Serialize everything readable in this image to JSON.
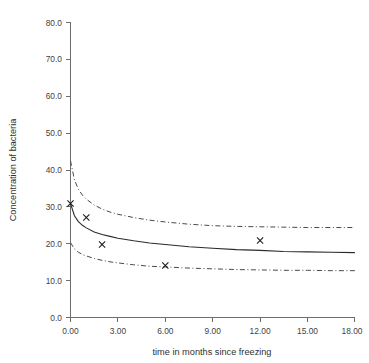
{
  "chart_data": {
    "type": "line",
    "title": "",
    "xlabel": "time in months since freezing",
    "ylabel": "Concentration of bacteria",
    "xlim": [
      0,
      18
    ],
    "ylim": [
      0,
      80
    ],
    "xticks": [
      "0.00",
      "3.00",
      "6.00",
      "9.00",
      "12.00",
      "15.00",
      "18.00"
    ],
    "xtick_values": [
      0,
      3,
      6,
      9,
      12,
      15,
      18
    ],
    "yticks": [
      "0.0",
      "10.0",
      "20.0",
      "30.0",
      "40.0",
      "50.0",
      "60.0",
      "70.0",
      "80.0"
    ],
    "ytick_values": [
      0,
      10,
      20,
      30,
      40,
      50,
      60,
      70,
      80
    ],
    "grid": false,
    "legend": "none",
    "series": [
      {
        "name": "fitted curve",
        "style": "solid",
        "color": "#2b2b2b",
        "x": [
          0.0,
          0.25,
          0.5,
          0.75,
          1.0,
          1.5,
          2.0,
          2.5,
          3.0,
          4.0,
          5.0,
          6.0,
          7.5,
          9.0,
          10.5,
          12.0,
          13.5,
          15.0,
          16.5,
          18.0
        ],
        "y": [
          30.9,
          27.6,
          26.0,
          25.0,
          24.3,
          23.2,
          22.5,
          22.0,
          21.5,
          20.8,
          20.2,
          19.8,
          19.2,
          18.8,
          18.4,
          18.2,
          17.9,
          17.8,
          17.7,
          17.6
        ]
      },
      {
        "name": "upper confidence band",
        "style": "dash-dot",
        "color": "#4a4a4a",
        "x": [
          0.0,
          0.25,
          0.5,
          0.75,
          1.0,
          1.5,
          2.0,
          2.5,
          3.0,
          4.0,
          5.0,
          6.0,
          7.5,
          9.0,
          10.5,
          12.0,
          13.5,
          15.0,
          16.5,
          18.0
        ],
        "y": [
          42.5,
          37.3,
          34.8,
          33.2,
          32.1,
          30.5,
          29.4,
          28.6,
          28.0,
          27.1,
          26.4,
          25.9,
          25.3,
          24.9,
          24.7,
          24.6,
          24.5,
          24.4,
          24.4,
          24.4
        ]
      },
      {
        "name": "lower confidence band",
        "style": "dash-dot",
        "color": "#4a4a4a",
        "x": [
          0.0,
          0.25,
          0.5,
          0.75,
          1.0,
          1.5,
          2.0,
          2.5,
          3.0,
          4.0,
          5.0,
          6.0,
          7.5,
          9.0,
          10.5,
          12.0,
          13.5,
          15.0,
          16.5,
          18.0
        ],
        "y": [
          20.3,
          18.6,
          17.7,
          17.1,
          16.7,
          16.0,
          15.5,
          15.1,
          14.8,
          14.3,
          13.9,
          13.7,
          13.4,
          13.2,
          13.0,
          12.9,
          12.8,
          12.8,
          12.7,
          12.7
        ]
      }
    ],
    "points": {
      "name": "observed data",
      "marker": "x",
      "color": "#1d1d1d",
      "x": [
        0.0,
        1.0,
        2.0,
        6.0,
        12.0
      ],
      "y": [
        30.9,
        27.1,
        19.8,
        14.1,
        20.9
      ]
    }
  },
  "axes": {
    "x_axis_title": "time in months since freezing",
    "y_axis_title": "Concentration of bacteria"
  }
}
